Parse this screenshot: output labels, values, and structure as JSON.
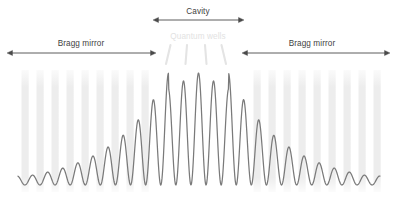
{
  "figure": {
    "width": 396,
    "height": 197,
    "background": "#ffffff"
  },
  "colors": {
    "wave": "#7a7a7a",
    "arrow": "#4a4a4a",
    "label": "#3f3f3f",
    "faint_label": "#e2e2e2",
    "bragg_layer": "#ededed",
    "quantum_well_tick": "#e4e4e4"
  },
  "annotations": [
    {
      "id": "cavity",
      "label": "Cavity",
      "label_x": 198,
      "label_y": 8,
      "arrow_y": 20,
      "arrow_x1": 153,
      "arrow_x2": 244,
      "style": "dark",
      "double_headed": true
    },
    {
      "id": "quantum-wells",
      "label": "Quantum wells",
      "label_x": 198,
      "label_y": 33,
      "arrow_y": null,
      "arrow_x1": null,
      "arrow_x2": null,
      "style": "faint",
      "double_headed": false
    },
    {
      "id": "bragg-mirror-left",
      "label": "Bragg mirror",
      "label_x": 81,
      "label_y": 40,
      "arrow_y": 53,
      "arrow_x1": 7,
      "arrow_x2": 156,
      "style": "dark",
      "double_headed": true
    },
    {
      "id": "bragg-mirror-right",
      "label": "Bragg mirror",
      "label_x": 312,
      "label_y": 40,
      "arrow_y": 53,
      "arrow_x1": 242,
      "arrow_x2": 390,
      "style": "dark",
      "double_headed": true
    }
  ],
  "bragg_layers": {
    "description": "Alternating high-index layers drawn as pale vertical bars",
    "top": 70,
    "bottom": 192,
    "bar_width": 7.2,
    "left_stack_x": [
      21.5,
      36.5,
      51.5,
      66.5,
      81.5,
      96.5,
      111.5,
      126.5,
      141.5
    ],
    "right_stack_x": [
      253.5,
      268.5,
      283.5,
      298.5,
      313.5,
      328.5,
      343.5,
      358.5,
      373.5
    ]
  },
  "quantum_wells": {
    "count": 4,
    "tick_y_top": 45,
    "tick_y_bottom": 64,
    "ticks": [
      {
        "x_top": 170.5,
        "x_bottom": 166.0
      },
      {
        "x_top": 187.0,
        "x_bottom": 185.5
      },
      {
        "x_top": 205.0,
        "x_bottom": 206.5
      },
      {
        "x_top": 221.5,
        "x_bottom": 226.0
      }
    ]
  },
  "chart_data": {
    "type": "line",
    "xlabel": "",
    "ylabel": "",
    "baseline_y": 185,
    "x_start": 18,
    "x_end": 380,
    "period_px": 15.1,
    "center_x": 198.5,
    "peak_amplitude_px": 112,
    "min_amplitude_px": 9,
    "decay_length_px": 56,
    "cavity_flat_half_width_px": 30,
    "envelope_samples": [
      {
        "x": 18,
        "amplitude": 9
      },
      {
        "x": 48,
        "amplitude": 14
      },
      {
        "x": 78,
        "amplitude": 22
      },
      {
        "x": 108,
        "amplitude": 37
      },
      {
        "x": 138,
        "amplitude": 62
      },
      {
        "x": 168,
        "amplitude": 104
      },
      {
        "x": 198,
        "amplitude": 112
      },
      {
        "x": 228,
        "amplitude": 104
      },
      {
        "x": 258,
        "amplitude": 62
      },
      {
        "x": 288,
        "amplitude": 37
      },
      {
        "x": 318,
        "amplitude": 22
      },
      {
        "x": 348,
        "amplitude": 14
      },
      {
        "x": 378,
        "amplitude": 9
      }
    ]
  }
}
